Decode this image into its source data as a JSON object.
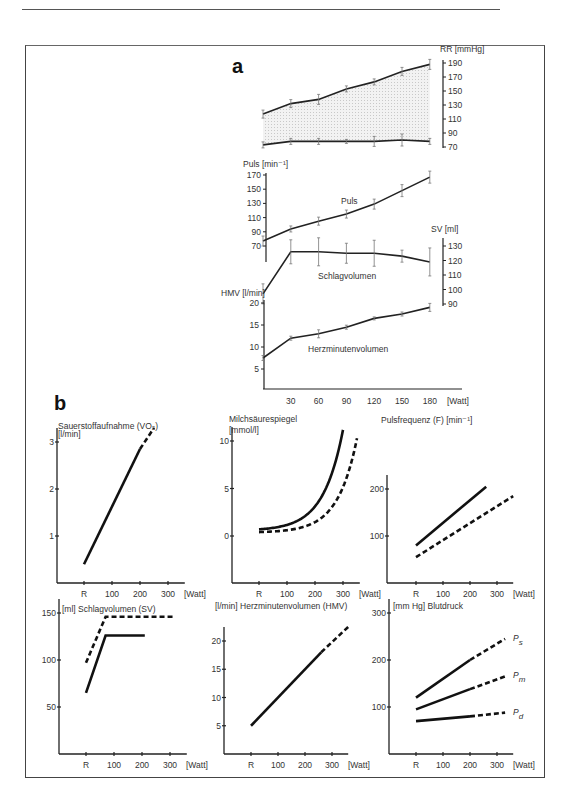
{
  "panel_a": {
    "label": "a",
    "x_ticks": [
      "30",
      "60",
      "90",
      "120",
      "150",
      "180"
    ],
    "x_unit": "[Watt]",
    "rr_axis_label": "RR [mmHg]",
    "rr_ticks": [
      "190",
      "170",
      "150",
      "130",
      "110",
      "90",
      "70"
    ],
    "puls_axis_label": "Puls [min⁻¹]",
    "puls_ticks": [
      "170",
      "150",
      "130",
      "110",
      "90",
      "70"
    ],
    "puls_curve_label": "Puls",
    "sv_axis_label": "SV [ml]",
    "sv_ticks": [
      "130",
      "120",
      "110",
      "100",
      "90"
    ],
    "sv_curve_label": "Schlagvolumen",
    "hmv_axis_label": "HMV [l/min]",
    "hmv_ticks": [
      "20",
      "15",
      "10",
      "5"
    ],
    "hmv_curve_label": "Herzminutenvolumen"
  },
  "panel_b": {
    "label": "b",
    "charts": [
      {
        "title": "Sauerstoffaufnahme (VO₂)",
        "unit": "[l/min]",
        "y_ticks": [
          "3",
          "2",
          "1"
        ],
        "x_ticks": [
          "R",
          "100",
          "200",
          "300"
        ],
        "x_unit": "[Watt]"
      },
      {
        "title": "Milchsäurespiegel",
        "unit": "[mmol/l]",
        "y_ticks": [
          "10",
          "5",
          "0"
        ],
        "x_ticks": [
          "R",
          "100",
          "200",
          "300"
        ],
        "x_unit": "[Watt]"
      },
      {
        "title": "Pulsfrequenz (F) [min⁻¹]",
        "unit": "",
        "y_ticks": [
          "200",
          "100"
        ],
        "x_ticks": [
          "R",
          "100",
          "200",
          "300"
        ],
        "x_unit": "[Watt]"
      },
      {
        "title": "[ml] Schlagvolumen (SV)",
        "unit": "",
        "y_ticks": [
          "150",
          "100",
          "50"
        ],
        "x_ticks": [
          "R",
          "100",
          "200",
          "300"
        ],
        "x_unit": "[Watt]"
      },
      {
        "title": "[l/min]  Herzminutenvolumen (HMV)",
        "unit": "",
        "y_ticks": [
          "20",
          "15",
          "10",
          "5"
        ],
        "x_ticks": [
          "R",
          "100",
          "200",
          "300"
        ],
        "x_unit": "[Watt]"
      },
      {
        "title": "[mm Hg] Blutdruck",
        "unit": "",
        "y_ticks": [
          "300",
          "200",
          "100"
        ],
        "x_ticks": [
          "R",
          "100",
          "200",
          "300"
        ],
        "x_unit": "[Watt]",
        "series_labels": [
          "Ps",
          "Pm",
          "Pd"
        ]
      }
    ]
  },
  "chart_data": [
    {
      "type": "line",
      "title": "a: RR [mmHg]",
      "x": [
        0,
        30,
        60,
        90,
        120,
        150,
        180
      ],
      "xlabel": "[Watt]",
      "ylabel": "RR [mmHg]",
      "ylim": [
        70,
        190
      ],
      "series": [
        {
          "name": "systolic",
          "values": [
            117,
            132,
            138,
            153,
            163,
            178,
            188
          ]
        },
        {
          "name": "diastolic",
          "values": [
            73,
            78,
            78,
            78,
            78,
            80,
            78
          ]
        }
      ]
    },
    {
      "type": "line",
      "title": "a: Puls [min-1]",
      "x": [
        0,
        30,
        60,
        90,
        120,
        150,
        180
      ],
      "xlabel": "[Watt]",
      "ylabel": "Puls [min-1]",
      "ylim": [
        70,
        170
      ],
      "series": [
        {
          "name": "Puls",
          "values": [
            77,
            94,
            105,
            115,
            129,
            148,
            167
          ]
        }
      ]
    },
    {
      "type": "line",
      "title": "a: SV [ml]",
      "x": [
        0,
        30,
        60,
        90,
        120,
        150,
        180
      ],
      "xlabel": "[Watt]",
      "ylabel": "SV [ml]",
      "ylim": [
        90,
        130
      ],
      "series": [
        {
          "name": "Schlagvolumen",
          "values": [
            97,
            126,
            126,
            125,
            125,
            123,
            119
          ]
        }
      ]
    },
    {
      "type": "line",
      "title": "a: HMV [l/min]",
      "x": [
        0,
        30,
        60,
        90,
        120,
        150,
        180
      ],
      "xlabel": "[Watt]",
      "ylabel": "HMV [l/min]",
      "ylim": [
        0,
        20
      ],
      "series": [
        {
          "name": "Herzminutenvolumen",
          "values": [
            7.5,
            12,
            13,
            14.5,
            16.5,
            17.5,
            19
          ]
        }
      ]
    },
    {
      "type": "line",
      "title": "Sauerstoffaufnahme (VO2)",
      "x": [
        0,
        200,
        250
      ],
      "xlabel": "[Watt]",
      "ylabel": "[l/min]",
      "ylim": [
        0,
        3.2
      ],
      "series": [
        {
          "name": "VO2",
          "values": [
            0.4,
            2.85,
            3.3
          ]
        }
      ]
    },
    {
      "type": "line",
      "title": "Milchsäurespiegel",
      "x": [
        0,
        100,
        200,
        250,
        300,
        350
      ],
      "xlabel": "[Watt]",
      "ylabel": "[mmol/l]",
      "ylim": [
        0,
        10
      ],
      "series": [
        {
          "name": "untrainiert (solid)",
          "values": [
            0.7,
            1.0,
            2.3,
            4.0,
            10.2,
            null
          ]
        },
        {
          "name": "trainiert (dashed)",
          "values": [
            0.4,
            0.5,
            1.3,
            2.2,
            4.0,
            10.2
          ]
        }
      ]
    },
    {
      "type": "line",
      "title": "Pulsfrequenz (F)",
      "x": [
        0,
        260,
        360
      ],
      "xlabel": "[Watt]",
      "ylabel": "[min-1]",
      "ylim": [
        0,
        280
      ],
      "series": [
        {
          "name": "untrainiert (solid)",
          "values": [
            80,
            205,
            null
          ]
        },
        {
          "name": "trainiert (dashed)",
          "values": [
            55,
            null,
            185
          ]
        }
      ]
    },
    {
      "type": "line",
      "title": "Schlagvolumen (SV)",
      "x": [
        0,
        70,
        210,
        310
      ],
      "xlabel": "[Watt]",
      "ylabel": "[ml]",
      "ylim": [
        0,
        160
      ],
      "series": [
        {
          "name": "untrainiert (solid)",
          "values": [
            65,
            126,
            126,
            null
          ]
        },
        {
          "name": "trainiert (dashed)",
          "values": [
            97,
            146,
            146,
            146
          ]
        }
      ]
    },
    {
      "type": "line",
      "title": "Herzminutenvolumen (HMV)",
      "x": [
        0,
        260,
        360
      ],
      "xlabel": "[Watt]",
      "ylabel": "[l/min]",
      "ylim": [
        0,
        24
      ],
      "series": [
        {
          "name": "HMV",
          "values": [
            5,
            18,
            22.5
          ]
        }
      ]
    },
    {
      "type": "line",
      "title": "Blutdruck",
      "x": [
        0,
        200,
        330
      ],
      "xlabel": "[Watt]",
      "ylabel": "[mm Hg]",
      "ylim": [
        0,
        300
      ],
      "series": [
        {
          "name": "Ps",
          "values": [
            120,
            200,
            245
          ]
        },
        {
          "name": "Pm",
          "values": [
            95,
            138,
            165
          ]
        },
        {
          "name": "Pd",
          "values": [
            70,
            80,
            88
          ]
        }
      ]
    }
  ]
}
